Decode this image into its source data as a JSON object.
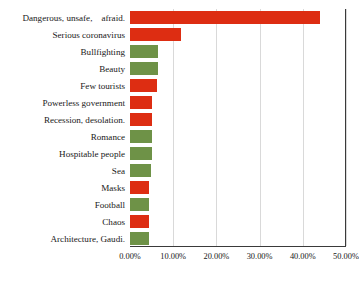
{
  "chart_data": {
    "type": "bar",
    "orientation": "horizontal",
    "title": "",
    "subtitle": "",
    "xlabel": "",
    "ylabel": "",
    "xlim": [
      0,
      0.5
    ],
    "ylim": null,
    "grid": true,
    "grid_axis": "x",
    "legend": null,
    "legend_position": "none",
    "value_format": "percent-2dp",
    "axis_ticks": [
      "0.00%",
      "10.00%",
      "20.00%",
      "30.00%",
      "40.00%",
      "50.00%"
    ],
    "axis_tick_values": [
      0.0,
      0.1,
      0.2,
      0.3,
      0.4,
      0.5
    ],
    "categories": [
      "Dangerous, unsafe,    afraid.",
      "Serious coronavirus",
      "Bullfighting",
      "Beauty",
      "Few tourists",
      "Powerless government",
      "Recession, desolation.",
      "Romance",
      "Hospitable people",
      "Sea",
      "Masks",
      "Football",
      "Chaos",
      "Architecture, Gaudi."
    ],
    "values": [
      0.44,
      0.118,
      0.064,
      0.064,
      0.062,
      0.05,
      0.05,
      0.05,
      0.05,
      0.048,
      0.045,
      0.044,
      0.044,
      0.044
    ],
    "bar_colors": [
      "#DD2D12",
      "#DD2D12",
      "#6E9247",
      "#6E9247",
      "#DD2D12",
      "#DD2D12",
      "#DD2D12",
      "#6E9247",
      "#6E9247",
      "#6E9247",
      "#DD2D12",
      "#6E9247",
      "#DD2D12",
      "#6E9247"
    ],
    "palette": {
      "negative": "#DD2D12",
      "positive": "#6E9247",
      "gridline": "#D9D9D9",
      "axis": "#3A3A3A",
      "text": "#181818",
      "background": "#FFFFFF"
    }
  }
}
